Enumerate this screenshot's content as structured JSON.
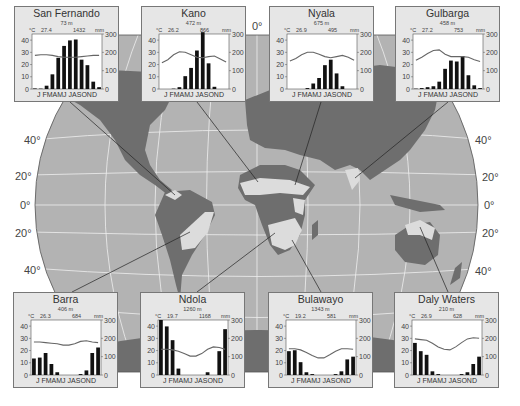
{
  "map": {
    "meridian_label": "0°",
    "lat_labels_left": [
      "40°",
      "20°",
      "0°",
      "20°",
      "40°"
    ],
    "lat_labels_right": [
      "40°",
      "20°",
      "0°",
      "20°",
      "40°"
    ],
    "colors": {
      "ocean": "#b3b3b3",
      "land_other": "#6e6e6e",
      "land_savanna": "#dcdcdc",
      "grid": "#efefef",
      "box_bg": "#e6e6e6"
    }
  },
  "chart_data": [
    {
      "type": "bar",
      "title": "San Fernando",
      "elevation": "73 m",
      "mean_temp": "27.4",
      "annual_precip": "1432",
      "temp_unit": "°C",
      "precip_unit": "mm",
      "categories": [
        "J",
        "F",
        "M",
        "A",
        "M",
        "J",
        "J",
        "A",
        "S",
        "O",
        "N",
        "D"
      ],
      "series": [
        {
          "name": "Precipitation (mm)",
          "axis": "right",
          "values": [
            3,
            2,
            18,
            80,
            170,
            235,
            265,
            270,
            160,
            130,
            40,
            10
          ]
        },
        {
          "name": "Temperature (°C)",
          "axis": "left",
          "values": [
            27.5,
            28,
            28,
            27.5,
            26.5,
            26,
            26,
            26,
            26.5,
            27,
            27.5,
            27.5
          ]
        }
      ],
      "left_ticks": [
        0,
        10,
        20,
        30,
        40
      ],
      "right_ticks": [
        0,
        100,
        200,
        300
      ],
      "ylim_left": [
        0,
        45
      ],
      "ylim_right": [
        0,
        300
      ]
    },
    {
      "type": "bar",
      "title": "Kano",
      "elevation": "472 m",
      "mean_temp": "26.2",
      "annual_precip": "866",
      "temp_unit": "°C",
      "precip_unit": "mm",
      "categories": [
        "J",
        "F",
        "M",
        "A",
        "M",
        "J",
        "J",
        "A",
        "S",
        "O",
        "N",
        "D"
      ],
      "series": [
        {
          "name": "Precipitation (mm)",
          "axis": "right",
          "values": [
            0,
            0,
            2,
            10,
            70,
            115,
            210,
            310,
            140,
            12,
            0,
            0
          ]
        },
        {
          "name": "Temperature (°C)",
          "axis": "left",
          "values": [
            21.5,
            24,
            28,
            30.5,
            30,
            28,
            26,
            25.5,
            26.5,
            27,
            24.5,
            22
          ]
        }
      ],
      "left_ticks": [
        0,
        10,
        20,
        30,
        40
      ],
      "right_ticks": [
        0,
        100,
        200,
        300
      ],
      "ylim_left": [
        0,
        45
      ],
      "ylim_right": [
        0,
        300
      ]
    },
    {
      "type": "bar",
      "title": "Nyala",
      "elevation": "675 m",
      "mean_temp": "26.9",
      "annual_precip": "495",
      "temp_unit": "°C",
      "precip_unit": "mm",
      "categories": [
        "J",
        "F",
        "M",
        "A",
        "M",
        "J",
        "J",
        "A",
        "S",
        "O",
        "N",
        "D"
      ],
      "series": [
        {
          "name": "Precipitation (mm)",
          "axis": "right",
          "values": [
            0,
            0,
            0,
            5,
            30,
            60,
            130,
            160,
            85,
            15,
            0,
            0
          ]
        },
        {
          "name": "Temperature (°C)",
          "axis": "left",
          "values": [
            23,
            25,
            28,
            30,
            30,
            28.5,
            26.5,
            25.5,
            26.5,
            27.5,
            26,
            23.5
          ]
        }
      ],
      "left_ticks": [
        0,
        10,
        20,
        30,
        40
      ],
      "right_ticks": [
        0,
        100,
        200,
        300
      ],
      "ylim_left": [
        0,
        45
      ],
      "ylim_right": [
        0,
        300
      ]
    },
    {
      "type": "bar",
      "title": "Gulbarga",
      "elevation": "458 m",
      "mean_temp": "27.2",
      "annual_precip": "753",
      "temp_unit": "°C",
      "precip_unit": "mm",
      "categories": [
        "J",
        "F",
        "M",
        "A",
        "M",
        "J",
        "J",
        "A",
        "S",
        "O",
        "N",
        "D"
      ],
      "series": [
        {
          "name": "Precipitation (mm)",
          "axis": "right",
          "values": [
            2,
            5,
            10,
            15,
            40,
            110,
            155,
            150,
            180,
            75,
            20,
            5
          ]
        },
        {
          "name": "Temperature (°C)",
          "axis": "left",
          "values": [
            23.5,
            26,
            29,
            31.5,
            32,
            28.5,
            26.5,
            26.5,
            26.5,
            26,
            24,
            22.5
          ]
        }
      ],
      "left_ticks": [
        0,
        10,
        20,
        30,
        40
      ],
      "right_ticks": [
        0,
        100,
        200,
        300
      ],
      "ylim_left": [
        0,
        45
      ],
      "ylim_right": [
        0,
        300
      ]
    },
    {
      "type": "bar",
      "title": "Barra",
      "elevation": "406 m",
      "mean_temp": "26.3",
      "annual_precip": "684",
      "temp_unit": "°C",
      "precip_unit": "mm",
      "categories": [
        "J",
        "F",
        "M",
        "A",
        "M",
        "J",
        "J",
        "A",
        "S",
        "O",
        "N",
        "D"
      ],
      "series": [
        {
          "name": "Precipitation (mm)",
          "axis": "right",
          "values": [
            90,
            95,
            120,
            60,
            15,
            0,
            0,
            0,
            5,
            25,
            120,
            150
          ]
        },
        {
          "name": "Temperature (°C)",
          "axis": "left",
          "values": [
            27,
            27,
            26.5,
            26,
            25.5,
            24.5,
            24.5,
            25.5,
            27.5,
            28,
            27,
            26.5
          ]
        }
      ],
      "left_ticks": [
        0,
        10,
        20,
        30,
        40
      ],
      "right_ticks": [
        0,
        100,
        200,
        300
      ],
      "ylim_left": [
        0,
        45
      ],
      "ylim_right": [
        0,
        300
      ]
    },
    {
      "type": "bar",
      "title": "Ndola",
      "elevation": "1260 m",
      "mean_temp": "19.7",
      "annual_precip": "1168",
      "temp_unit": "°C",
      "precip_unit": "mm",
      "categories": [
        "J",
        "F",
        "M",
        "A",
        "M",
        "J",
        "J",
        "A",
        "S",
        "O",
        "N",
        "D"
      ],
      "series": [
        {
          "name": "Precipitation (mm)",
          "axis": "right",
          "values": [
            300,
            265,
            190,
            35,
            0,
            0,
            0,
            0,
            15,
            0,
            130,
            250
          ]
        },
        {
          "name": "Temperature (°C)",
          "axis": "left",
          "values": [
            21,
            21,
            20.5,
            19.5,
            17.5,
            15.5,
            15.5,
            17.5,
            21,
            23,
            22.5,
            21
          ]
        }
      ],
      "left_ticks": [
        0,
        10,
        20,
        30,
        40
      ],
      "right_ticks": [
        0,
        100,
        200,
        300
      ],
      "ylim_left": [
        0,
        45
      ],
      "ylim_right": [
        0,
        300
      ]
    },
    {
      "type": "bar",
      "title": "Bulawayo",
      "elevation": "1343 m",
      "mean_temp": "19.2",
      "annual_precip": "581",
      "temp_unit": "°C",
      "precip_unit": "mm",
      "categories": [
        "J",
        "F",
        "M",
        "A",
        "M",
        "J",
        "J",
        "A",
        "S",
        "O",
        "N",
        "D"
      ],
      "series": [
        {
          "name": "Precipitation (mm)",
          "axis": "right",
          "values": [
            130,
            135,
            70,
            15,
            5,
            0,
            0,
            0,
            5,
            20,
            85,
            100
          ]
        },
        {
          "name": "Temperature (°C)",
          "axis": "left",
          "values": [
            21.5,
            21.5,
            20.5,
            18.5,
            16,
            14,
            14,
            16.5,
            19.5,
            21.5,
            21.5,
            21
          ]
        }
      ],
      "left_ticks": [
        0,
        10,
        20,
        30,
        40
      ],
      "right_ticks": [
        0,
        100,
        200,
        300
      ],
      "ylim_left": [
        0,
        45
      ],
      "ylim_right": [
        0,
        300
      ]
    },
    {
      "type": "bar",
      "title": "Daly Waters",
      "elevation": "210 m",
      "mean_temp": "26.9",
      "annual_precip": "628",
      "temp_unit": "°C",
      "precip_unit": "mm",
      "categories": [
        "J",
        "F",
        "M",
        "A",
        "M",
        "J",
        "J",
        "A",
        "S",
        "O",
        "N",
        "D"
      ],
      "series": [
        {
          "name": "Precipitation (mm)",
          "axis": "right",
          "values": [
            175,
            130,
            110,
            20,
            5,
            0,
            0,
            0,
            5,
            15,
            60,
            100
          ]
        },
        {
          "name": "Temperature (°C)",
          "axis": "left",
          "values": [
            29.5,
            29,
            28.5,
            26,
            23,
            21,
            20.5,
            23,
            26.5,
            29.5,
            30.5,
            30
          ]
        }
      ],
      "left_ticks": [
        0,
        10,
        20,
        30,
        40
      ],
      "right_ticks": [
        0,
        100,
        200,
        300
      ],
      "ylim_left": [
        0,
        45
      ],
      "ylim_right": [
        0,
        300
      ]
    }
  ],
  "labels": {
    "month_axis": "J FMAMJ JASOND",
    "temp_unit": "°C",
    "precip_unit": "mm"
  }
}
